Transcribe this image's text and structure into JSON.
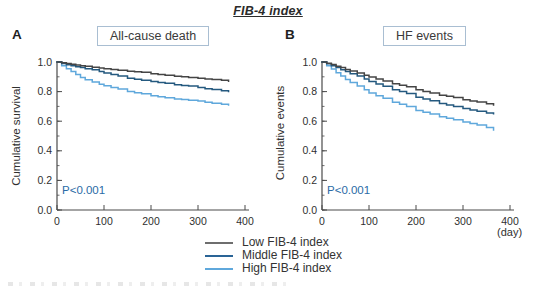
{
  "figure": {
    "title": "FIB-4 index",
    "day_unit": "(day)"
  },
  "panels": [
    {
      "letter": "A",
      "box_title": "All-cause death",
      "ylabel": "Cumulative survival",
      "pvalue": "P<0.001"
    },
    {
      "letter": "B",
      "box_title": "HF events",
      "ylabel": "Cumulative events",
      "pvalue": "P<0.001"
    }
  ],
  "legend": {
    "items": [
      {
        "label": "Low FIB-4 index",
        "color": "#6e6e6e"
      },
      {
        "label": "Middle FIB-4 index",
        "color": "#2a6496"
      },
      {
        "label": "High FIB-4 index",
        "color": "#5fa8dc"
      }
    ]
  },
  "colors": {
    "axis": "#4a4a4a",
    "low_line": "#454545",
    "middle_line": "#24597f",
    "high_line": "#5fa8dc",
    "pvalue_blue": "#2a6ba6",
    "box_border": "#a9bed2"
  },
  "chart_data": [
    {
      "type": "line",
      "subtype": "kaplan-meier-step",
      "panel": "A",
      "title": "All-cause death",
      "xlabel": "day",
      "ylabel": "Cumulative survival",
      "annotation": "P<0.001",
      "xlim": [
        0,
        400
      ],
      "ylim": [
        0.0,
        1.0
      ],
      "xticks": [
        0,
        100,
        200,
        300,
        400
      ],
      "yticks": [
        0.0,
        0.2,
        0.4,
        0.6,
        0.8,
        1.0
      ],
      "minor_ytick_step": 0.1,
      "grid": false,
      "legend_position": "below-figure",
      "x": [
        0,
        10,
        20,
        30,
        40,
        50,
        60,
        75,
        90,
        100,
        115,
        130,
        150,
        165,
        180,
        200,
        215,
        230,
        250,
        265,
        280,
        300,
        315,
        330,
        350,
        365
      ],
      "series": [
        {
          "name": "Low FIB-4 index",
          "color": "#454545",
          "values": [
            1.0,
            0.995,
            0.99,
            0.985,
            0.98,
            0.975,
            0.972,
            0.965,
            0.96,
            0.955,
            0.95,
            0.945,
            0.938,
            0.934,
            0.93,
            0.921,
            0.915,
            0.91,
            0.903,
            0.9,
            0.896,
            0.89,
            0.885,
            0.882,
            0.876,
            0.87
          ]
        },
        {
          "name": "Middle FIB-4 index",
          "color": "#24597f",
          "values": [
            1.0,
            0.99,
            0.982,
            0.975,
            0.968,
            0.962,
            0.955,
            0.947,
            0.935,
            0.925,
            0.915,
            0.905,
            0.89,
            0.883,
            0.877,
            0.868,
            0.862,
            0.856,
            0.847,
            0.842,
            0.837,
            0.827,
            0.82,
            0.814,
            0.806,
            0.8
          ]
        },
        {
          "name": "High FIB-4 index",
          "color": "#5fa8dc",
          "values": [
            1.0,
            0.975,
            0.955,
            0.935,
            0.915,
            0.895,
            0.88,
            0.865,
            0.85,
            0.84,
            0.828,
            0.817,
            0.8,
            0.792,
            0.785,
            0.772,
            0.765,
            0.758,
            0.75,
            0.746,
            0.742,
            0.736,
            0.728,
            0.722,
            0.714,
            0.71
          ]
        }
      ]
    },
    {
      "type": "line",
      "subtype": "kaplan-meier-step",
      "panel": "B",
      "title": "HF events",
      "xlabel": "day",
      "ylabel": "Cumulative events",
      "annotation": "P<0.001",
      "xlim": [
        0,
        400
      ],
      "ylim": [
        0.0,
        1.0
      ],
      "xticks": [
        0,
        100,
        200,
        300,
        400
      ],
      "yticks": [
        0.0,
        0.2,
        0.4,
        0.6,
        0.8,
        1.0
      ],
      "minor_ytick_step": 0.1,
      "grid": false,
      "legend_position": "below-figure",
      "x": [
        0,
        10,
        20,
        30,
        40,
        50,
        60,
        75,
        90,
        100,
        115,
        130,
        150,
        165,
        180,
        200,
        215,
        230,
        250,
        265,
        280,
        300,
        315,
        330,
        350,
        365
      ],
      "series": [
        {
          "name": "Low FIB-4 index",
          "color": "#454545",
          "values": [
            1.0,
            0.992,
            0.983,
            0.972,
            0.962,
            0.95,
            0.94,
            0.925,
            0.91,
            0.898,
            0.885,
            0.872,
            0.853,
            0.843,
            0.832,
            0.812,
            0.8,
            0.79,
            0.775,
            0.768,
            0.76,
            0.745,
            0.737,
            0.73,
            0.718,
            0.71
          ]
        },
        {
          "name": "Middle FIB-4 index",
          "color": "#24597f",
          "values": [
            1.0,
            0.988,
            0.975,
            0.962,
            0.948,
            0.935,
            0.92,
            0.905,
            0.885,
            0.868,
            0.852,
            0.836,
            0.812,
            0.8,
            0.788,
            0.762,
            0.75,
            0.738,
            0.72,
            0.71,
            0.7,
            0.685,
            0.676,
            0.668,
            0.656,
            0.65
          ]
        },
        {
          "name": "High FIB-4 index",
          "color": "#5fa8dc",
          "values": [
            1.0,
            0.975,
            0.952,
            0.928,
            0.905,
            0.882,
            0.862,
            0.838,
            0.812,
            0.79,
            0.772,
            0.755,
            0.728,
            0.714,
            0.7,
            0.672,
            0.66,
            0.648,
            0.63,
            0.62,
            0.61,
            0.595,
            0.585,
            0.575,
            0.558,
            0.54
          ]
        }
      ]
    }
  ]
}
